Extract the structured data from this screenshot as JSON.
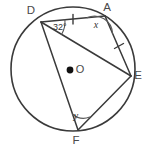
{
  "figure": {
    "kind": "circle-geometry-diagram",
    "background_color": "#ffffff",
    "line_color": "#3a3a3a",
    "label_color": "#4a4a4a",
    "width": 147,
    "height": 148
  },
  "circle": {
    "center_label": "O",
    "center_x": 73,
    "center_y": 69,
    "radius": 62,
    "center_dot_x": 70,
    "center_dot_y": 70
  },
  "points": [
    {
      "label": "D",
      "x": 41,
      "y": 22,
      "label_x": 31,
      "label_y": 14
    },
    {
      "label": "A",
      "x": 105,
      "y": 16,
      "label_x": 107,
      "label_y": 11
    },
    {
      "label": "E",
      "x": 131,
      "y": 76,
      "label_x": 138,
      "label_y": 79
    },
    {
      "label": "F",
      "x": 78,
      "y": 130,
      "label_x": 76,
      "label_y": 144
    }
  ],
  "chords": [
    {
      "name": "chord-DA",
      "from": "D",
      "to": "A"
    },
    {
      "name": "chord-DE",
      "from": "D",
      "to": "E"
    },
    {
      "name": "chord-DF",
      "from": "D",
      "to": "F"
    },
    {
      "name": "chord-AE",
      "from": "A",
      "to": "E"
    },
    {
      "name": "chord-EF",
      "from": "E",
      "to": "F"
    }
  ],
  "angles": [
    {
      "name": "angle-at-D",
      "vertex": "D",
      "value": "32°",
      "label_x": 53,
      "label_y": 30,
      "arc_radius": 24
    },
    {
      "name": "angle-at-A",
      "vertex": "A",
      "value": "x",
      "label_x": 96,
      "label_y": 28,
      "arc_radius": 18
    },
    {
      "name": "angle-at-F",
      "vertex": "F",
      "value": "y",
      "label_x": 76,
      "label_y": 119,
      "arc_radius": 17
    }
  ],
  "tick_marks": [
    {
      "name": "tick-chord-DA",
      "x": 73,
      "y": 19
    },
    {
      "name": "tick-chord-AE",
      "x": 119,
      "y": 46
    }
  ]
}
